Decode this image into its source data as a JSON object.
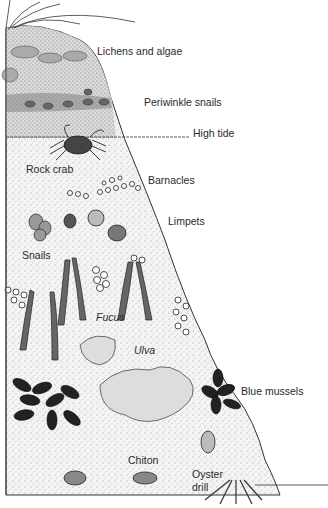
{
  "diagram": {
    "labels": {
      "lichens": "Lichens and algae",
      "periwinkle": "Periwinkle snails",
      "high_tide": "High tide",
      "rock_crab": "Rock crab",
      "barnacles": "Barnacles",
      "limpets": "Limpets",
      "snails": "Snails",
      "fucus": "Fucus",
      "ulva": "Ulva",
      "blue_mussels": "Blue mussels",
      "chiton": "Chiton",
      "oyster_drill_1": "Oyster",
      "oyster_drill_2": "drill"
    }
  }
}
